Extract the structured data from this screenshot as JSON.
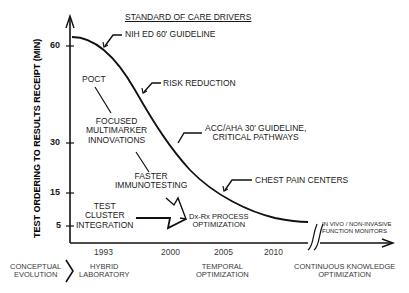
{
  "diagram": {
    "y_axis_label": "TEST ORDERING TO RESULTS RECEIPT (MIN)",
    "y_ticks": [
      "60",
      "30",
      "15",
      "5"
    ],
    "x_ticks": [
      "1993",
      "2000",
      "2005",
      "2010"
    ],
    "header": "STANDARD OF CARE DRIVERS",
    "drivers": {
      "nih": "NIH ED 60' GUIDELINE",
      "risk": "RISK REDUCTION",
      "acc_line1": "ACC/AHA 30' GUIDELINE,",
      "acc_line2": "CRITICAL PATHWAYS",
      "chest": "CHEST PAIN CENTERS"
    },
    "innovations": {
      "poct": "POCT",
      "focused_1": "FOCUSED",
      "focused_2": "MULTIMARKER",
      "focused_3": "INNOVATIONS",
      "faster_1": "FASTER",
      "faster_2": "IMMUNOTESTING",
      "test_1": "TEST",
      "test_2": "CLUSTER",
      "test_3": "INTEGRATION",
      "dxrx_1": "Dx-Rx PROCESS",
      "dxrx_2": "OPTIMIZATION",
      "invivo_1": "IN VIVO / NON-INVASIVE",
      "invivo_2": "FUNCTION MONITORS"
    },
    "evolution": {
      "conceptual_1": "CONCEPTUAL",
      "conceptual_2": "EVOLUTION",
      "hybrid_1": "HYBRID",
      "hybrid_2": "LABORATORY",
      "temporal_1": "TEMPORAL",
      "temporal_2": "OPTIMIZATION",
      "continuous_1": "CONTINUOUS KNOWLEDGE",
      "continuous_2": "OPTIMIZATION"
    },
    "colors": {
      "line": "#111111",
      "text": "#1a1a1a",
      "background": "#ffffff"
    }
  }
}
